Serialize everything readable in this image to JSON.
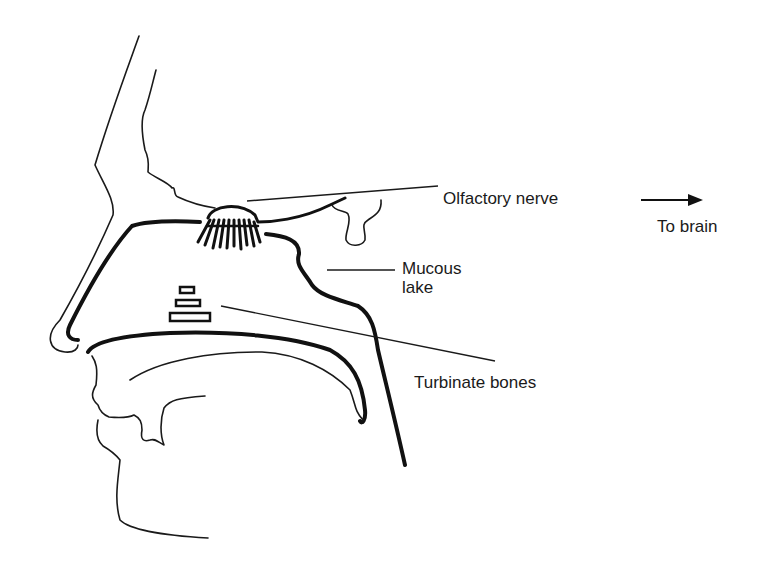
{
  "diagram": {
    "labels": {
      "olfactory_nerve": "Olfactory nerve",
      "to_brain": "To brain",
      "mucous_lake_line1": "Mucous",
      "mucous_lake_line2": "lake",
      "turbinate_bones": "Turbinate bones"
    },
    "icons": {
      "direction_arrow": "right-arrow"
    },
    "colors": {
      "line": "#111111",
      "background": "#ffffff"
    }
  }
}
